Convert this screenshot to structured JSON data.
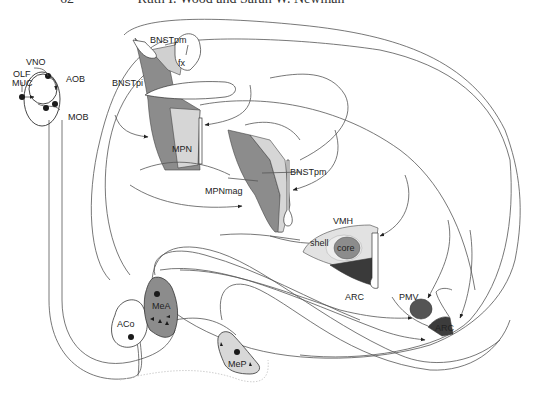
{
  "header": {
    "page_number": "62",
    "authors": "Ruth I. Wood and Sarah W. Newman"
  },
  "colors": {
    "dark_gray": "#5f5f5f",
    "mid_gray": "#8c8c8c",
    "light_gray": "#d0d0d0",
    "very_light_gray": "#e6e6e6",
    "line": "#555555",
    "dot": "#1a1a1a"
  },
  "labels": {
    "vno": "VNO",
    "olf_muc_line1": "OLF",
    "olf_muc_line2": "MUC",
    "aob": "AOB",
    "mob": "MOB",
    "bnstpm_top": "BNSTpm",
    "fx": "fx",
    "bnstpi": "BNSTpi",
    "mpn": "MPN",
    "bnstpm_mid": "BNSTpm",
    "mpnmag": "MPNmag",
    "vmh": "VMH",
    "shell": "shell",
    "core": "core",
    "arc_vmh": "ARC",
    "pmv": "PMV",
    "arc_pmv": "ARC",
    "aco": "ACo",
    "mea": "MeA",
    "mep": "MeP"
  }
}
